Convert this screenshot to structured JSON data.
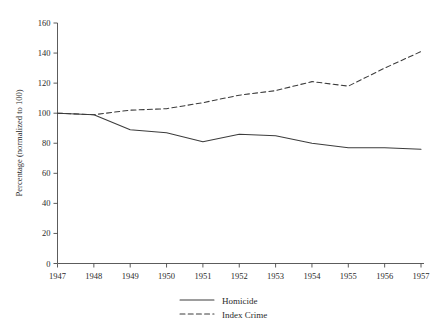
{
  "chart_data": {
    "type": "line",
    "title": "",
    "xlabel": "",
    "ylabel": "Percentage (normalized to 100)",
    "xlim": [
      1947,
      1957
    ],
    "ylim": [
      0,
      160
    ],
    "ytick_step": 20,
    "grid": false,
    "legend_position": "bottom",
    "x": [
      1947,
      1948,
      1949,
      1950,
      1951,
      1952,
      1953,
      1954,
      1955,
      1956,
      1957
    ],
    "xtick_labels": [
      "1947",
      "1948",
      "1949",
      "1950",
      "1951",
      "1952",
      "1953",
      "1954",
      "1955",
      "1956",
      "1957"
    ],
    "ytick_labels": [
      "0",
      "20",
      "40",
      "60",
      "80",
      "100",
      "120",
      "140",
      "160"
    ],
    "series": [
      {
        "name": "Homicide",
        "style": "solid",
        "color": "#3c3c3c",
        "values": [
          100,
          99,
          89,
          87,
          81,
          86,
          85,
          80,
          77,
          77,
          76
        ]
      },
      {
        "name": "Index Crime",
        "style": "dashed",
        "color": "#3c3c3c",
        "values": [
          100,
          99,
          102,
          103,
          107,
          112,
          115,
          121,
          118,
          130,
          141
        ]
      }
    ],
    "legend": [
      {
        "label": "Homicide",
        "style": "solid"
      },
      {
        "label": "Index Crime",
        "style": "dashed"
      }
    ]
  },
  "axes": {
    "y_title": "Percentage (normalized to 100)"
  }
}
